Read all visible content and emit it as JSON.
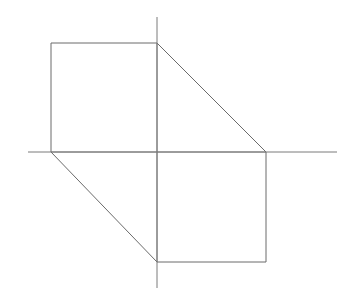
{
  "figure": {
    "background_color": "#ffffff",
    "width": 343,
    "height": 298,
    "line_color": "#6a6a6a",
    "axis_color": "#7a7a7a",
    "line_width": 1
  },
  "chart_data": {
    "type": "line",
    "subtitle": "",
    "xlabel": "",
    "ylabel": "",
    "grid": false,
    "legend": "none",
    "annotations": [],
    "axes": {
      "origin": {
        "x": 157,
        "y": 152
      },
      "x_axis": {
        "x1": 28,
        "y1": 152,
        "x2": 337,
        "y2": 152,
        "label": "",
        "ticks": []
      },
      "y_axis": {
        "x1": 157,
        "y1": 17,
        "x2": 157,
        "y2": 288,
        "label": "",
        "ticks": []
      }
    },
    "series": [
      {
        "name": "hexagon-outline",
        "closed": true,
        "points": [
          {
            "x": 51,
            "y": 43,
            "name": "top-left-vertex"
          },
          {
            "x": 157,
            "y": 43,
            "name": "top-middle-vertex"
          },
          {
            "x": 266,
            "y": 152,
            "name": "right-vertex"
          },
          {
            "x": 266,
            "y": 262,
            "name": "bottom-right-vertex"
          },
          {
            "x": 157,
            "y": 262,
            "name": "bottom-middle-vertex"
          },
          {
            "x": 51,
            "y": 152,
            "name": "left-vertex"
          }
        ]
      }
    ],
    "edges": [
      {
        "name": "top-edge",
        "x1": 51,
        "y1": 43,
        "x2": 157,
        "y2": 43
      },
      {
        "name": "upper-right-diagonal",
        "x1": 157,
        "y1": 43,
        "x2": 266,
        "y2": 152
      },
      {
        "name": "right-edge",
        "x1": 266,
        "y1": 152,
        "x2": 266,
        "y2": 262
      },
      {
        "name": "bottom-edge",
        "x1": 266,
        "y1": 262,
        "x2": 157,
        "y2": 262
      },
      {
        "name": "lower-left-diagonal",
        "x1": 157,
        "y1": 262,
        "x2": 51,
        "y2": 152
      },
      {
        "name": "left-edge",
        "x1": 51,
        "y1": 152,
        "x2": 51,
        "y2": 43
      }
    ],
    "interior_segments": [
      {
        "name": "interior-vertical",
        "x1": 157,
        "y1": 43,
        "x2": 157,
        "y2": 262
      },
      {
        "name": "interior-horizontal",
        "x1": 51,
        "y1": 152,
        "x2": 266,
        "y2": 152
      }
    ],
    "xlim": [
      0,
      343
    ],
    "ylim": [
      298,
      0
    ]
  }
}
